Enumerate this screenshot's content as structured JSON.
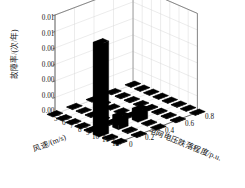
{
  "chart_data": {
    "type": "bar",
    "title": "",
    "subtitle": "",
    "projection": "3d-bar",
    "xlabel": "风速/(m/s)",
    "ylabel": "故障率/(次/年)",
    "zlabel": "电网电压跌落程度/p.u.",
    "xticks": [
      "5",
      "6",
      "7",
      "8",
      "9",
      "10",
      "11",
      "12"
    ],
    "yticks": [
      "0.000",
      "0.002",
      "0.004",
      "0.006",
      "0.008",
      "0.010",
      "0.012"
    ],
    "zticks": [
      "0",
      "0.2",
      "0.4",
      "0.6",
      "0.8"
    ],
    "xlim": [
      5,
      12
    ],
    "ylim": [
      0.0,
      0.012
    ],
    "zlim": [
      0.0,
      0.8
    ],
    "grid": true,
    "legend": false,
    "bar_color": "#000000",
    "grid_color": "#d8d8d8",
    "axis_color": "#4a4a4a",
    "categories_x": [
      5,
      6,
      7,
      8,
      9,
      10,
      11,
      12
    ],
    "categories_z": [
      0.0,
      0.2,
      0.4,
      0.6,
      0.8
    ],
    "values": [
      [
        4e-05,
        4e-05,
        4e-05,
        4e-05,
        4e-05
      ],
      [
        4e-05,
        4e-05,
        4e-05,
        4e-05,
        4e-05
      ],
      [
        5e-05,
        5e-05,
        4e-05,
        4e-05,
        4e-05
      ],
      [
        6e-05,
        5e-05,
        5e-05,
        4e-05,
        4e-05
      ],
      [
        0.0001,
        8e-05,
        6e-05,
        5e-05,
        4e-05
      ],
      [
        0.0112,
        0.0015,
        0.0014,
        8e-05,
        5e-05
      ],
      [
        0.00012,
        9e-05,
        7e-05,
        5e-05,
        4e-05
      ],
      [
        8e-05,
        6e-05,
        5e-05,
        4e-05,
        4e-05
      ]
    ],
    "max_value": 0.0112,
    "max_value_x": 10,
    "max_value_z": 0.0
  }
}
